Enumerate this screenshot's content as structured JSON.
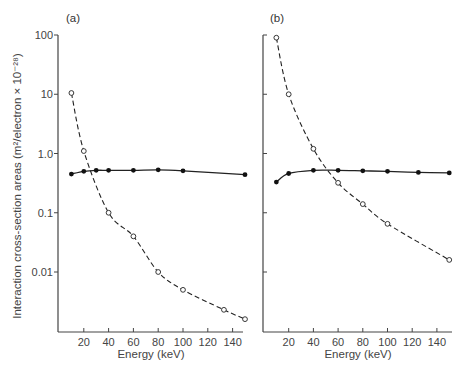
{
  "chart_data": [
    {
      "type": "line",
      "panel_label": "(a)",
      "xlabel": "Energy (keV)",
      "ylabel": "Interaction cross-section areas (m²/electron × 10⁻²⁸)",
      "yscale": "log",
      "ylim": [
        0.001,
        100
      ],
      "xlim": [
        0,
        150
      ],
      "xticks": [
        20,
        40,
        60,
        80,
        100,
        120,
        140
      ],
      "yticks": [
        "100",
        "10",
        "1.0",
        "0.1",
        "0.01"
      ],
      "grid": false,
      "series": [
        {
          "name": "open circles (dashed)",
          "marker": "open-circle",
          "line": "dashed",
          "x": [
            10,
            20,
            40,
            60,
            80,
            100,
            133,
            150
          ],
          "y": [
            10.5,
            1.1,
            0.1,
            0.04,
            0.01,
            0.005,
            0.0023,
            0.0016
          ]
        },
        {
          "name": "filled circles (solid)",
          "marker": "filled-circle",
          "line": "solid",
          "x": [
            10,
            20,
            30,
            40,
            60,
            80,
            100,
            150
          ],
          "y": [
            0.45,
            0.5,
            0.52,
            0.52,
            0.52,
            0.53,
            0.51,
            0.44
          ]
        }
      ]
    },
    {
      "type": "line",
      "panel_label": "(b)",
      "xlabel": "Energy (keV)",
      "ylabel": "",
      "yscale": "log",
      "ylim": [
        0.001,
        100
      ],
      "xlim": [
        0,
        150
      ],
      "xticks": [
        20,
        40,
        60,
        80,
        100,
        120,
        140
      ],
      "yticks": [],
      "grid": false,
      "series": [
        {
          "name": "open circles (dashed)",
          "marker": "open-circle",
          "line": "dashed",
          "x": [
            10,
            20,
            40,
            60,
            80,
            100,
            150
          ],
          "y": [
            90,
            10,
            1.2,
            0.32,
            0.14,
            0.065,
            0.016
          ]
        },
        {
          "name": "filled circles (solid)",
          "marker": "filled-circle",
          "line": "solid",
          "x": [
            10,
            20,
            40,
            60,
            80,
            100,
            125,
            150
          ],
          "y": [
            0.33,
            0.46,
            0.52,
            0.52,
            0.51,
            0.5,
            0.48,
            0.47
          ]
        }
      ]
    }
  ]
}
